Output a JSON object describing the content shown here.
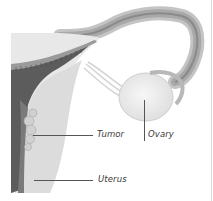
{
  "figure": {
    "labels": {
      "tumor": "Tumor",
      "ovary": "Ovary",
      "uterus": "Uterus"
    },
    "colors": {
      "background": "#ffffff",
      "tissue_light": "#e6e6e6",
      "tissue_mid": "#bdbdbd",
      "tissue_dark": "#5a5a5a",
      "ovary": "#efefef",
      "leader_line": "#555555",
      "label_text": "#3a3a3a"
    }
  }
}
